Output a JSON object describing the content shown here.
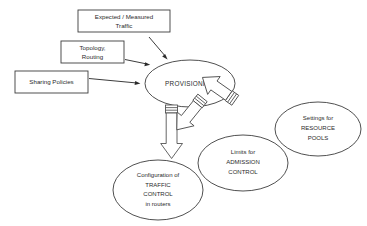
{
  "diagram": {
    "background_color": "#ffffff",
    "line_color": "#3c3c3c",
    "text_color": "#2b2b2b",
    "inputs": [
      {
        "id": "expected-measured-traffic",
        "shape": "rectangle",
        "lines": [
          "Expected / Measured",
          "Traffic"
        ]
      },
      {
        "id": "topology-routing",
        "shape": "rectangle",
        "lines": [
          "Topology,",
          "Routing"
        ]
      },
      {
        "id": "sharing-policies",
        "shape": "rectangle",
        "lines": [
          "Sharing Policies"
        ]
      }
    ],
    "process": {
      "id": "provisioning",
      "shape": "ellipse",
      "lines": [
        "PROVISIONING"
      ]
    },
    "outputs": [
      {
        "id": "traffic-control",
        "shape": "ellipse",
        "lines": [
          "Configuration of",
          "TRAFFIC",
          "CONTROL",
          "in routers"
        ]
      },
      {
        "id": "admission-control",
        "shape": "ellipse",
        "lines": [
          "Limits for",
          "ADMISSION",
          "CONTROL"
        ]
      },
      {
        "id": "resource-pools",
        "shape": "ellipse",
        "lines": [
          "Settings for",
          "RESOURCE",
          "POOLS"
        ]
      }
    ],
    "connectors": {
      "input_arrows": 3,
      "output_block_arrows": 3,
      "input_arrow_style": "thin-line-solid-head",
      "output_arrow_style": "block-arrow-striped-tail"
    }
  }
}
